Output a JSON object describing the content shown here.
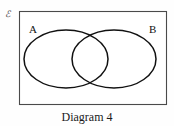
{
  "figure": {
    "caption": "Diagram 4",
    "universal_set_symbol": "ℰ",
    "universal_set_name": "script-epsilon-universal-set",
    "type": "venn-diagram",
    "sets": [
      {
        "label": "A",
        "position": "left"
      },
      {
        "label": "B",
        "position": "right"
      }
    ],
    "colors": {
      "background": "#fefefe",
      "rectangle_border": "#4a4a4a",
      "ellipse_stroke": "#111111",
      "label_text": "#111111",
      "caption_text": "#1a1a1a",
      "symbol_text": "#3a3a3a"
    },
    "geometry": {
      "rectangle": {
        "x": 19,
        "y": 11,
        "width": 148,
        "height": 94
      },
      "ellipse_left": {
        "cx": 66,
        "cy": 59,
        "rx": 42,
        "ry": 29
      },
      "ellipse_right": {
        "cx": 114,
        "cy": 59,
        "rx": 42,
        "ry": 29
      }
    }
  }
}
